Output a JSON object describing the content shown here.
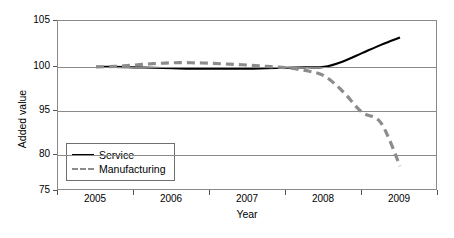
{
  "chart_data": {
    "type": "line",
    "title": "",
    "xlabel": "Year",
    "ylabel": "Added value",
    "grid": true,
    "legend_position": "bottom-left-inside",
    "xlim": [
      2005,
      2009
    ],
    "ylim": [
      75,
      105
    ],
    "x_tick_labels": [
      "2005",
      "2006",
      "2007",
      "2008",
      "2009"
    ],
    "y_tick_labels": [
      "105",
      "100",
      "95",
      "80",
      "75"
    ],
    "y_tick_values": [
      105,
      100,
      95,
      80,
      75
    ],
    "y_tick_pixel_fractions": [
      0.0,
      0.27,
      0.53,
      0.79,
      1.0
    ],
    "series": [
      {
        "name": "Service",
        "style": "solid",
        "color": "#000000",
        "x": [
          2005.0,
          2005.25,
          2005.5,
          2005.75,
          2006.0,
          2006.25,
          2006.5,
          2006.75,
          2007.0,
          2007.25,
          2007.5,
          2007.75,
          2008.0,
          2008.25,
          2008.5,
          2008.75,
          2009.0
        ],
        "values": [
          100.0,
          100.0,
          99.95,
          99.9,
          99.85,
          99.8,
          99.8,
          99.8,
          99.8,
          99.85,
          99.9,
          99.95,
          100.0,
          100.6,
          101.5,
          102.4,
          103.2
        ]
      },
      {
        "name": "Manufacturing",
        "style": "dashed",
        "color": "#8c8c8c",
        "x": [
          2005.0,
          2005.25,
          2005.5,
          2005.75,
          2006.0,
          2006.25,
          2006.5,
          2006.75,
          2007.0,
          2007.25,
          2007.5,
          2007.75,
          2008.0,
          2008.25,
          2008.5,
          2008.75,
          2009.0
        ],
        "values": [
          100.0,
          100.05,
          100.2,
          100.35,
          100.45,
          100.45,
          100.4,
          100.3,
          100.2,
          100.05,
          99.9,
          99.6,
          99.0,
          97.2,
          94.6,
          91.0,
          78.5
        ]
      }
    ],
    "legend_entries": [
      {
        "label": "Service",
        "style": "solid",
        "color": "#000000"
      },
      {
        "label": "Manufacturing",
        "style": "dashed",
        "color": "#8c8c8c"
      }
    ]
  },
  "axes": {
    "y_title": "Added value",
    "x_title": "Year"
  }
}
